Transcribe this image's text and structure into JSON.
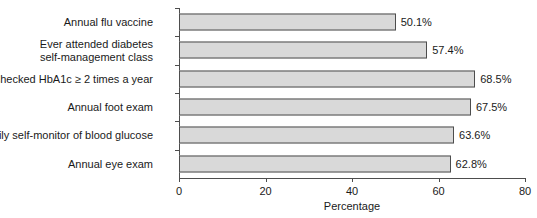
{
  "chart_data": {
    "type": "bar",
    "orientation": "horizontal",
    "title": "",
    "xlabel": "Percentage",
    "ylabel": "",
    "xlim": [
      0,
      80
    ],
    "xticks": [
      0,
      20,
      40,
      60,
      80
    ],
    "grid": false,
    "legend": null,
    "categories": [
      "Annual flu vaccine",
      "Ever attended diabetes\nself-management class",
      "Checked HbA1c ≥ 2 times a year",
      "Annual foot exam",
      "Daily self-monitor of blood glucose",
      "Annual eye exam"
    ],
    "values": [
      50.1,
      57.4,
      68.5,
      67.5,
      63.6,
      62.8
    ],
    "value_labels": [
      "50.1%",
      "57.4%",
      "68.5%",
      "67.5%",
      "63.6%",
      "62.8%"
    ],
    "bar_fill_color": "#d9d9d9",
    "bar_border_color": "#4d4d4d",
    "axis_color": "#4d4d4d",
    "background_color": "#ffffff"
  }
}
